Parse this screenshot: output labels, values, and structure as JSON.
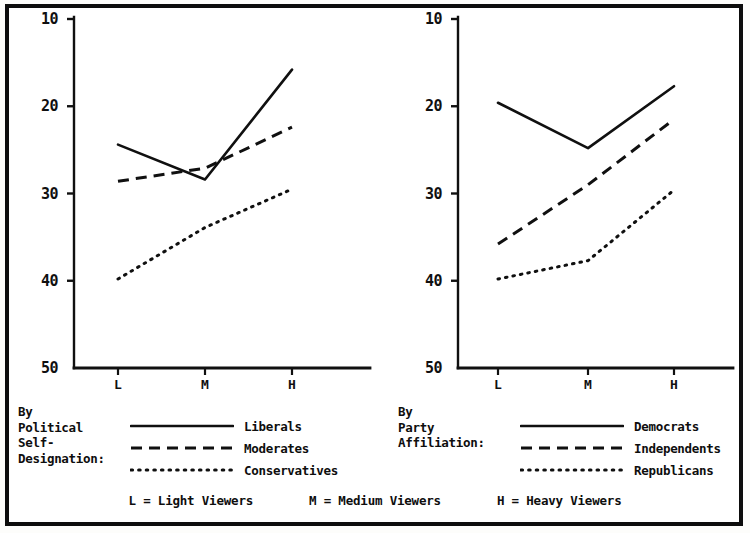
{
  "figure": {
    "background_color": "#ffffff",
    "ink_color": "#101010",
    "border_color": "#0d0d0d"
  },
  "axis": {
    "y_ticks": [
      "50",
      "40",
      "30",
      "20",
      "10"
    ],
    "y_values": [
      50,
      40,
      30,
      20,
      10
    ],
    "x_ticks": [
      "L",
      "M",
      "H"
    ]
  },
  "left_legend": {
    "caption": "By\nPolitical\nSelf-\nDesignation:",
    "entries": [
      {
        "label": "Liberals",
        "style": "solid"
      },
      {
        "label": "Moderates",
        "style": "dashed"
      },
      {
        "label": "Conservatives",
        "style": "dotted"
      }
    ]
  },
  "right_legend": {
    "caption": "By\nParty\nAffiliation:",
    "entries": [
      {
        "label": "Democrats",
        "style": "solid"
      },
      {
        "label": "Independents",
        "style": "dashed"
      },
      {
        "label": "Republicans",
        "style": "dotted"
      }
    ]
  },
  "bottom_key": [
    "L = Light Viewers",
    "M = Medium Viewers",
    "H = Heavy Viewers"
  ],
  "chart_data": [
    {
      "id": "left",
      "type": "line",
      "title": "",
      "xlabel": "",
      "ylabel": "",
      "categories": [
        "L",
        "M",
        "H"
      ],
      "category_meanings": [
        "Light Viewers",
        "Medium Viewers",
        "Heavy Viewers"
      ],
      "ylim": [
        10,
        50
      ],
      "y_ticks": [
        10,
        20,
        30,
        40,
        50
      ],
      "grid": false,
      "legend_position": "below",
      "legend_title": "By Political Self-Designation:",
      "series": [
        {
          "name": "Liberals",
          "style": "solid",
          "values": [
            35.6,
            31.6,
            44.2
          ]
        },
        {
          "name": "Moderates",
          "style": "dashed",
          "values": [
            31.4,
            32.9,
            37.6
          ]
        },
        {
          "name": "Conservatives",
          "style": "dotted",
          "values": [
            20.2,
            26.1,
            30.5
          ]
        }
      ]
    },
    {
      "id": "right",
      "type": "line",
      "title": "",
      "xlabel": "",
      "ylabel": "",
      "categories": [
        "L",
        "M",
        "H"
      ],
      "category_meanings": [
        "Light Viewers",
        "Medium Viewers",
        "Heavy Viewers"
      ],
      "ylim": [
        10,
        50
      ],
      "y_ticks": [
        10,
        20,
        30,
        40,
        50
      ],
      "grid": false,
      "legend_position": "below",
      "legend_title": "By Party Affiliation:",
      "series": [
        {
          "name": "Democrats",
          "style": "solid",
          "values": [
            40.4,
            35.2,
            42.3
          ]
        },
        {
          "name": "Independents",
          "style": "dashed",
          "values": [
            24.2,
            31.0,
            38.5
          ]
        },
        {
          "name": "Republicans",
          "style": "dotted",
          "values": [
            20.2,
            22.3,
            30.4
          ]
        }
      ]
    }
  ]
}
